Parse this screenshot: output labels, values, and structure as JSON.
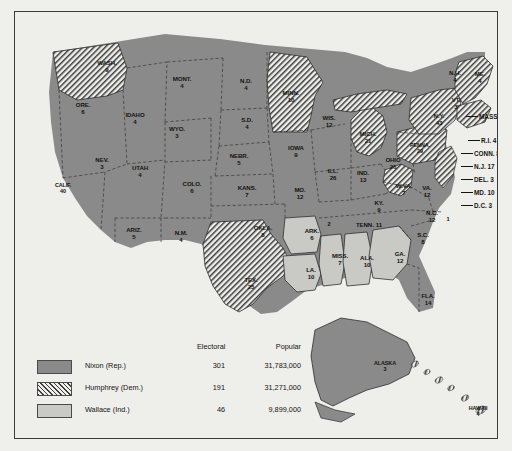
{
  "legend": {
    "headers": {
      "electoral": "Electoral",
      "popular": "Popular"
    },
    "rows": [
      {
        "swatch": "solid-dark-gray",
        "candidate": "Nixon (Rep.)",
        "electoral": "301",
        "popular": "31,783,000"
      },
      {
        "swatch": "diagonal-hatch",
        "candidate": "Humphrey (Dem.)",
        "electoral": "191",
        "popular": "31,271,000"
      },
      {
        "swatch": "solid-light-gray",
        "candidate": "Wallace (Ind.)",
        "electoral": "46",
        "popular": "9,899,000"
      }
    ]
  },
  "colors": {
    "nixon": "#8a8a8a",
    "wallace": "#c9c9c6",
    "humphrey_hatch_line": "#3c3c3c",
    "background": "#eeeeeb",
    "border": "#3b3b3b",
    "state_line": "#2e2e2e",
    "text": "#14140f"
  },
  "states": [
    {
      "abbr": "WASH.",
      "ev": "9",
      "party": "humphrey",
      "x": 92,
      "y": 55
    },
    {
      "abbr": "ORE.",
      "ev": "6",
      "party": "nixon",
      "x": 68,
      "y": 97
    },
    {
      "abbr": "CALIF.",
      "ev": "40",
      "party": "nixon",
      "x": 48,
      "y": 177
    },
    {
      "abbr": "NEV.",
      "ev": "3",
      "party": "nixon",
      "x": 87,
      "y": 152
    },
    {
      "abbr": "IDAHO",
      "ev": "4",
      "party": "nixon",
      "x": 120,
      "y": 107
    },
    {
      "abbr": "MONT.",
      "ev": "4",
      "party": "nixon",
      "x": 167,
      "y": 71
    },
    {
      "abbr": "WYO.",
      "ev": "3",
      "party": "nixon",
      "x": 162,
      "y": 121
    },
    {
      "abbr": "UTAH",
      "ev": "4",
      "party": "nixon",
      "x": 125,
      "y": 160
    },
    {
      "abbr": "ARIZ.",
      "ev": "5",
      "party": "nixon",
      "x": 119,
      "y": 222
    },
    {
      "abbr": "COLO.",
      "ev": "6",
      "party": "nixon",
      "x": 177,
      "y": 176
    },
    {
      "abbr": "N.M.",
      "ev": "4",
      "party": "nixon",
      "x": 166,
      "y": 225
    },
    {
      "abbr": "N.D.",
      "ev": "4",
      "party": "nixon",
      "x": 231,
      "y": 73
    },
    {
      "abbr": "S.D.",
      "ev": "4",
      "party": "nixon",
      "x": 232,
      "y": 112
    },
    {
      "abbr": "NEBR.",
      "ev": "5",
      "party": "nixon",
      "x": 224,
      "y": 148
    },
    {
      "abbr": "KANS.",
      "ev": "7",
      "party": "nixon",
      "x": 232,
      "y": 180
    },
    {
      "abbr": "OKLA.",
      "ev": "8",
      "party": "nixon",
      "x": 248,
      "y": 220
    },
    {
      "abbr": "TEX.",
      "ev": "25",
      "party": "humphrey",
      "x": 236,
      "y": 272
    },
    {
      "abbr": "MINN.",
      "ev": "10",
      "party": "humphrey",
      "x": 276,
      "y": 85
    },
    {
      "abbr": "IOWA",
      "ev": "9",
      "party": "nixon",
      "x": 281,
      "y": 140
    },
    {
      "abbr": "MO.",
      "ev": "12",
      "party": "nixon",
      "x": 285,
      "y": 182
    },
    {
      "abbr": "ARK.",
      "ev": "6",
      "party": "wallace",
      "x": 297,
      "y": 223
    },
    {
      "abbr": "LA.",
      "ev": "10",
      "party": "wallace",
      "x": 296,
      "y": 262
    },
    {
      "abbr": "WIS.",
      "ev": "12",
      "party": "nixon",
      "x": 314,
      "y": 110
    },
    {
      "abbr": "ILL.",
      "ev": "26",
      "party": "nixon",
      "x": 318,
      "y": 163
    },
    {
      "abbr": "MISS.",
      "ev": "7",
      "party": "wallace",
      "x": 325,
      "y": 248
    },
    {
      "abbr": "IND.",
      "ev": "13",
      "party": "nixon",
      "x": 348,
      "y": 165
    },
    {
      "abbr": "MICH.",
      "ev": "21",
      "party": "humphrey",
      "x": 353,
      "y": 126
    },
    {
      "abbr": "OHIO",
      "ev": "26",
      "party": "nixon",
      "x": 378,
      "y": 152
    },
    {
      "abbr": "KY.",
      "ev": "9",
      "party": "nixon",
      "x": 364,
      "y": 195
    },
    {
      "abbr": "TENN.",
      "ev": "11",
      "party": "nixon",
      "x": 354,
      "y": 213,
      "inline": true
    },
    {
      "abbr": "ALA.",
      "ev": "10",
      "party": "wallace",
      "x": 352,
      "y": 250
    },
    {
      "abbr": "GA.",
      "ev": "12",
      "party": "wallace",
      "x": 385,
      "y": 246
    },
    {
      "abbr": "FLA.",
      "ev": "14",
      "party": "nixon",
      "x": 413,
      "y": 288
    },
    {
      "abbr": "S.C.",
      "ev": "8",
      "party": "nixon",
      "x": 408,
      "y": 227
    },
    {
      "abbr": "N.C.",
      "ev": "12",
      "party": "nixon",
      "x": 417,
      "y": 205
    },
    {
      "abbr": "VA.",
      "ev": "12",
      "party": "nixon",
      "x": 412,
      "y": 180
    },
    {
      "abbr": "W.VA.",
      "ev": "7",
      "party": "humphrey",
      "x": 389,
      "y": 178
    },
    {
      "abbr": "PENNA.",
      "ev": "29",
      "party": "humphrey",
      "x": 405,
      "y": 137
    },
    {
      "abbr": "N.Y.",
      "ev": "43",
      "party": "humphrey",
      "x": 424,
      "y": 108
    },
    {
      "abbr": "VT.",
      "ev": "3",
      "party": "nixon",
      "x": 441,
      "y": 92
    },
    {
      "abbr": "N.H.",
      "ev": "4",
      "party": "nixon",
      "x": 440,
      "y": 65
    },
    {
      "abbr": "ME.",
      "ev": "4",
      "party": "humphrey",
      "x": 465,
      "y": 66
    },
    {
      "abbr": "ALASKA",
      "ev": "3",
      "party": "nixon",
      "x": 370,
      "y": 355
    },
    {
      "abbr": "HAWAII",
      "ev": "4",
      "party": "humphrey",
      "x": 463,
      "y": 400
    }
  ],
  "callouts": [
    {
      "label": "MASS. 14",
      "party": "humphrey",
      "x": 464,
      "y": 104
    },
    {
      "label": "R.I. 4",
      "party": "humphrey",
      "x": 466,
      "y": 128
    },
    {
      "label": "CONN. 8",
      "party": "humphrey",
      "x": 459,
      "y": 141
    },
    {
      "label": "N.J. 17",
      "party": "humphrey",
      "x": 459,
      "y": 154
    },
    {
      "label": "DEL. 3",
      "party": "humphrey",
      "x": 459,
      "y": 167
    },
    {
      "label": "MD. 10",
      "party": "humphrey",
      "x": 459,
      "y": 180
    },
    {
      "label": "D.C. 3",
      "party": "humphrey",
      "x": 459,
      "y": 193
    }
  ],
  "elector_markers": [
    {
      "label": "1",
      "x": 433,
      "y": 207
    },
    {
      "label": "2",
      "x": 314,
      "y": 212
    }
  ]
}
